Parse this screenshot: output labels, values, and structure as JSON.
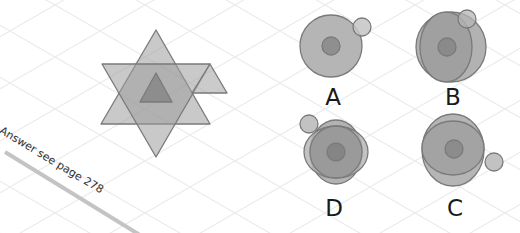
{
  "puzzle": {
    "caption": "Answer see page 278",
    "options": [
      {
        "id": "A",
        "label": "A"
      },
      {
        "id": "B",
        "label": "B"
      },
      {
        "id": "D",
        "label": "D"
      },
      {
        "id": "C",
        "label": "C"
      }
    ]
  },
  "colors": {
    "shape_fill": "#999999",
    "shape_stroke": "#777777",
    "grid": "#ececec",
    "bar": "#c4c4c4"
  }
}
